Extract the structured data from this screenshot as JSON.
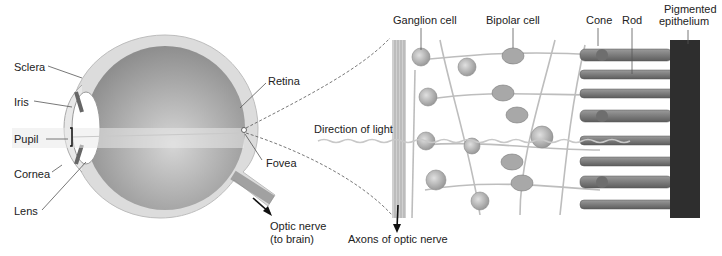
{
  "diagram": {
    "eye_labels": {
      "sclera": "Sclera",
      "iris": "Iris",
      "pupil": "Pupil",
      "cornea": "Cornea",
      "lens": "Lens",
      "retina": "Retina",
      "fovea": "Fovea",
      "optic_nerve_line1": "Optic nerve",
      "optic_nerve_line2": "(to brain)"
    },
    "retina_labels": {
      "ganglion_cell": "Ganglion cell",
      "bipolar_cell": "Bipolar cell",
      "cone": "Cone",
      "rod": "Rod",
      "pigmented_line1": "Pigmented",
      "pigmented_line2": "epithelium",
      "direction_of_light": "Direction of light",
      "axons": "Axons of optic nerve"
    },
    "colors": {
      "eye_outer": "#d9d9d9",
      "eye_inner": "#a9a9a9",
      "cell_fill": "#b8b8b8",
      "cell_dark": "#6e6e6e",
      "epithelium": "#2e2e2e",
      "text": "#222222"
    }
  }
}
